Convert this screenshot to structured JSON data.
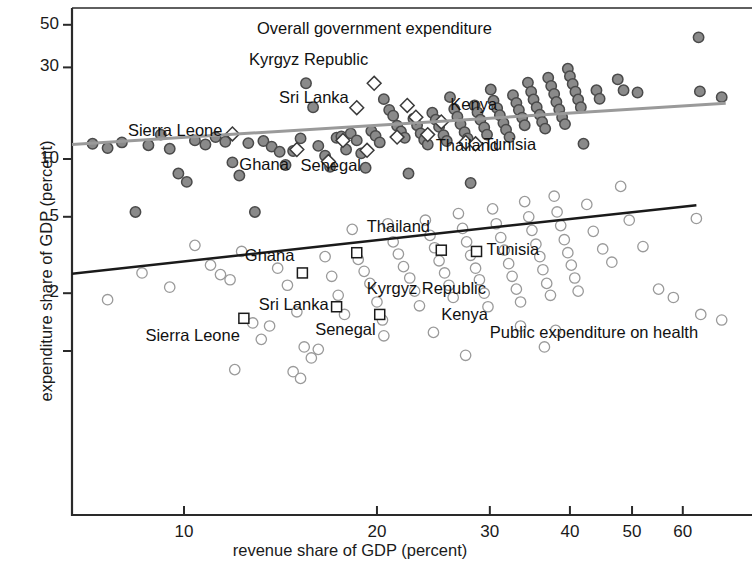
{
  "figure": {
    "axes": {
      "x": {
        "label": "revenue share of GDP (percent)",
        "scale": "log",
        "ticks": [
          10,
          20,
          30,
          40,
          50,
          60
        ],
        "tick_labels": [
          "10",
          "20",
          "30",
          "40",
          "50",
          "60"
        ],
        "range": [
          3.0,
          70.0
        ]
      },
      "y": {
        "label": "expenditure share of GDP (percent)",
        "scale": "log",
        "ticks": [
          50,
          30,
          10,
          5,
          2,
          1
        ],
        "tick_labels": [
          "50",
          "30",
          "10",
          "5",
          "2",
          ""
        ],
        "range": [
          0.55,
          62.0
        ]
      }
    },
    "annotations": {
      "overall_title": "Overall government expenditure",
      "health_title": "Public expenditure on health"
    }
  },
  "chart_data": {
    "type": "scatter",
    "title": "",
    "xlabel": "revenue share of GDP (percent)",
    "ylabel": "expenditure share of GDP (percent)",
    "xscale": "log",
    "yscale": "log",
    "xlim": [
      3.0,
      70.0
    ],
    "ylim": [
      0.55,
      62.0
    ],
    "xticks": [
      10,
      20,
      30,
      40,
      50,
      60
    ],
    "yticks": [
      50,
      30,
      10,
      5,
      2,
      1
    ],
    "grid": false,
    "legend": "none",
    "series": [
      {
        "name": "Overall government expenditure",
        "marker": "circle-filled",
        "color": "#8a8a8a",
        "edge": "#4a4a4a",
        "points": [
          [
            3.3,
            9.2
          ],
          [
            4.0,
            10.3
          ],
          [
            4.5,
            10.5
          ],
          [
            5.1,
            10.8
          ],
          [
            5.6,
            5.5
          ],
          [
            6.4,
            11.6
          ],
          [
            7.2,
            12.0
          ],
          [
            7.6,
            11.4
          ],
          [
            8.0,
            12.2
          ],
          [
            8.4,
            5.3
          ],
          [
            8.8,
            11.8
          ],
          [
            9.2,
            13.4
          ],
          [
            9.5,
            11.3
          ],
          [
            9.8,
            8.4
          ],
          [
            10.1,
            7.6
          ],
          [
            10.4,
            12.5
          ],
          [
            10.8,
            11.9
          ],
          [
            11.2,
            13.0
          ],
          [
            11.6,
            12.3
          ],
          [
            11.9,
            9.6
          ],
          [
            12.2,
            8.2
          ],
          [
            12.6,
            12.1
          ],
          [
            12.9,
            5.3
          ],
          [
            13.3,
            12.4
          ],
          [
            13.7,
            11.6
          ],
          [
            14.1,
            10.9
          ],
          [
            14.4,
            9.3
          ],
          [
            14.8,
            11.0
          ],
          [
            15.2,
            12.8
          ],
          [
            15.5,
            24.8
          ],
          [
            15.9,
            18.6
          ],
          [
            16.2,
            11.7
          ],
          [
            16.6,
            10.4
          ],
          [
            16.9,
            9.1
          ],
          [
            17.3,
            12.9
          ],
          [
            17.6,
            13.1
          ],
          [
            17.9,
            11.2
          ],
          [
            18.2,
            13.6
          ],
          [
            18.6,
            12.5
          ],
          [
            18.9,
            10.7
          ],
          [
            19.2,
            9.0
          ],
          [
            19.6,
            14.0
          ],
          [
            19.9,
            13.2
          ],
          [
            20.2,
            12.2
          ],
          [
            20.5,
            20.5
          ],
          [
            20.9,
            18.0
          ],
          [
            21.2,
            16.8
          ],
          [
            21.5,
            14.9
          ],
          [
            21.8,
            13.9
          ],
          [
            22.1,
            12.9
          ],
          [
            22.4,
            8.4
          ],
          [
            22.8,
            16.2
          ],
          [
            23.1,
            15.0
          ],
          [
            23.4,
            13.6
          ],
          [
            23.7,
            12.6
          ],
          [
            24.0,
            11.9
          ],
          [
            24.4,
            17.4
          ],
          [
            24.7,
            16.0
          ],
          [
            25.0,
            14.7
          ],
          [
            25.4,
            13.3
          ],
          [
            25.7,
            12.4
          ],
          [
            26.0,
            21.0
          ],
          [
            26.4,
            18.2
          ],
          [
            26.7,
            16.6
          ],
          [
            27.0,
            15.2
          ],
          [
            27.4,
            13.8
          ],
          [
            27.7,
            12.8
          ],
          [
            28.0,
            7.5
          ],
          [
            28.4,
            19.0
          ],
          [
            28.7,
            17.5
          ],
          [
            29.0,
            16.0
          ],
          [
            29.4,
            14.6
          ],
          [
            29.7,
            13.4
          ],
          [
            30.1,
            23.0
          ],
          [
            30.4,
            20.1
          ],
          [
            30.8,
            18.4
          ],
          [
            31.1,
            16.9
          ],
          [
            31.5,
            15.4
          ],
          [
            31.8,
            14.2
          ],
          [
            32.2,
            13.0
          ],
          [
            32.6,
            21.5
          ],
          [
            33.0,
            19.6
          ],
          [
            33.3,
            18.0
          ],
          [
            33.7,
            16.4
          ],
          [
            34.0,
            15.0
          ],
          [
            34.4,
            25.0
          ],
          [
            34.8,
            22.4
          ],
          [
            35.1,
            20.4
          ],
          [
            35.5,
            18.6
          ],
          [
            35.9,
            17.0
          ],
          [
            36.2,
            15.6
          ],
          [
            36.6,
            14.4
          ],
          [
            37.0,
            26.5
          ],
          [
            37.4,
            24.0
          ],
          [
            37.8,
            21.8
          ],
          [
            38.1,
            19.8
          ],
          [
            38.5,
            18.1
          ],
          [
            38.9,
            16.5
          ],
          [
            39.3,
            15.2
          ],
          [
            39.7,
            29.5
          ],
          [
            40.0,
            27.0
          ],
          [
            40.4,
            24.6
          ],
          [
            40.8,
            22.4
          ],
          [
            41.2,
            20.4
          ],
          [
            41.6,
            18.6
          ],
          [
            42.0,
            12.0
          ],
          [
            44.0,
            22.8
          ],
          [
            44.5,
            20.6
          ],
          [
            47.5,
            26.0
          ],
          [
            48.5,
            22.8
          ],
          [
            51.0,
            22.2
          ],
          [
            63.5,
            43.0
          ],
          [
            63.8,
            22.5
          ],
          [
            69.0,
            21.0
          ]
        ]
      },
      {
        "name": "Overall government expenditure (highlighted countries)",
        "marker": "diamond",
        "color": "#ffffff",
        "edge": "#3a3a3a",
        "points": [
          [
            11.9,
            13.5
          ],
          [
            15.0,
            11.2
          ],
          [
            16.8,
            9.7
          ],
          [
            17.7,
            12.5
          ],
          [
            18.6,
            18.5
          ],
          [
            19.3,
            11.1
          ],
          [
            19.8,
            24.8
          ],
          [
            21.5,
            13.0
          ],
          [
            22.3,
            19.0
          ],
          [
            23.0,
            16.5
          ],
          [
            24.0,
            13.4
          ],
          [
            25.2,
            15.6
          ],
          [
            27.5,
            12.2
          ],
          [
            28.5,
            12.0
          ]
        ]
      },
      {
        "name": "Public expenditure on health",
        "marker": "circle-open",
        "color": "#ffffff",
        "edge": "#9a9a9a",
        "points": [
          [
            3.4,
            1.72
          ],
          [
            5.0,
            1.55
          ],
          [
            6.2,
            1.3
          ],
          [
            7.6,
            1.85
          ],
          [
            8.6,
            2.55
          ],
          [
            9.5,
            2.15
          ],
          [
            10.4,
            3.55
          ],
          [
            11.0,
            2.8
          ],
          [
            11.4,
            2.5
          ],
          [
            11.8,
            2.35
          ],
          [
            12.3,
            3.3
          ],
          [
            12.8,
            1.4
          ],
          [
            13.2,
            1.15
          ],
          [
            13.6,
            1.35
          ],
          [
            14.0,
            2.7
          ],
          [
            14.5,
            2.2
          ],
          [
            15.0,
            1.6
          ],
          [
            15.4,
            1.05
          ],
          [
            15.8,
            0.92
          ],
          [
            16.2,
            1.02
          ],
          [
            16.6,
            3.1
          ],
          [
            17.0,
            2.45
          ],
          [
            17.4,
            1.95
          ],
          [
            17.8,
            1.55
          ],
          [
            18.3,
            4.3
          ],
          [
            18.7,
            3.0
          ],
          [
            19.1,
            2.6
          ],
          [
            19.5,
            2.25
          ],
          [
            20.0,
            1.8
          ],
          [
            20.4,
            1.45
          ],
          [
            20.8,
            4.6
          ],
          [
            21.2,
            3.7
          ],
          [
            21.6,
            3.2
          ],
          [
            22.0,
            2.75
          ],
          [
            22.5,
            2.4
          ],
          [
            22.9,
            2.05
          ],
          [
            23.3,
            1.72
          ],
          [
            23.8,
            4.8
          ],
          [
            24.2,
            4.0
          ],
          [
            24.6,
            3.45
          ],
          [
            25.0,
            2.95
          ],
          [
            25.5,
            2.55
          ],
          [
            25.9,
            2.2
          ],
          [
            26.3,
            1.9
          ],
          [
            26.8,
            5.2
          ],
          [
            27.2,
            4.35
          ],
          [
            27.6,
            3.7
          ],
          [
            28.0,
            3.15
          ],
          [
            28.5,
            2.7
          ],
          [
            28.9,
            2.35
          ],
          [
            29.4,
            2.0
          ],
          [
            29.8,
            1.7
          ],
          [
            30.3,
            5.5
          ],
          [
            30.7,
            4.6
          ],
          [
            31.2,
            3.9
          ],
          [
            31.6,
            3.35
          ],
          [
            32.1,
            2.85
          ],
          [
            32.5,
            2.45
          ],
          [
            33.0,
            2.1
          ],
          [
            33.5,
            1.8
          ],
          [
            34.0,
            6.0
          ],
          [
            34.5,
            5.0
          ],
          [
            34.9,
            4.25
          ],
          [
            35.4,
            3.6
          ],
          [
            35.9,
            3.1
          ],
          [
            36.3,
            2.65
          ],
          [
            36.8,
            2.25
          ],
          [
            37.3,
            1.95
          ],
          [
            37.8,
            6.4
          ],
          [
            38.2,
            5.3
          ],
          [
            38.7,
            4.5
          ],
          [
            39.2,
            3.8
          ],
          [
            39.7,
            3.25
          ],
          [
            40.2,
            2.8
          ],
          [
            40.7,
            2.4
          ],
          [
            41.2,
            2.05
          ],
          [
            42.5,
            5.8
          ],
          [
            43.5,
            4.2
          ],
          [
            45.0,
            3.4
          ],
          [
            46.5,
            2.9
          ],
          [
            48.0,
            7.2
          ],
          [
            49.5,
            4.8
          ],
          [
            52.0,
            3.5
          ],
          [
            55.0,
            2.1
          ],
          [
            58.0,
            1.9
          ],
          [
            63.0,
            4.9
          ],
          [
            64.0,
            1.55
          ],
          [
            69.0,
            1.45
          ],
          [
            12.0,
            0.8
          ],
          [
            14.8,
            0.78
          ],
          [
            15.2,
            0.72
          ],
          [
            20.5,
            1.2
          ],
          [
            24.5,
            1.25
          ],
          [
            27.5,
            0.95
          ],
          [
            33.5,
            1.35
          ],
          [
            36.5,
            1.05
          ],
          [
            38.0,
            1.28
          ]
        ]
      },
      {
        "name": "Public expenditure on health (highlighted countries)",
        "marker": "square",
        "color": "#ffffff",
        "edge": "#1a1a1a",
        "points": [
          [
            12.4,
            1.48
          ],
          [
            15.3,
            2.55
          ],
          [
            17.3,
            1.7
          ],
          [
            18.6,
            3.25
          ],
          [
            20.2,
            1.55
          ],
          [
            25.2,
            3.35
          ],
          [
            28.6,
            3.3
          ]
        ]
      }
    ],
    "fit_lines": [
      {
        "name": "overall-government-expenditure-fit",
        "color": "#9a9a9a",
        "width": 3,
        "x": [
          3.2,
          70.0
        ],
        "y": [
          10.2,
          19.5
        ]
      },
      {
        "name": "public-expenditure-on-health-fit",
        "color": "#1a1a1a",
        "width": 2.5,
        "x": [
          3.3,
          63.0
        ],
        "y": [
          1.95,
          5.75
        ]
      }
    ],
    "point_labels": [
      {
        "text": "Sierra Leone",
        "series": "overall",
        "x": 11.9,
        "y": 13.5,
        "anchor": "right"
      },
      {
        "text": "Ghana",
        "series": "overall",
        "x": 15.0,
        "y": 11.2,
        "anchor": "left-below"
      },
      {
        "text": "Sri Lanka",
        "series": "overall",
        "x": 18.6,
        "y": 18.5,
        "anchor": "left"
      },
      {
        "text": "Senegal",
        "series": "overall",
        "x": 19.3,
        "y": 11.1,
        "anchor": "below"
      },
      {
        "text": "Kyrgyz Republic",
        "series": "overall",
        "x": 19.8,
        "y": 24.8,
        "anchor": "above"
      },
      {
        "text": "Kenya",
        "series": "overall",
        "x": 25.2,
        "y": 18.5,
        "anchor": "right"
      },
      {
        "text": "Thailand",
        "series": "overall",
        "x": 24.0,
        "y": 13.4,
        "anchor": "right"
      },
      {
        "text": "Tunisia",
        "series": "overall",
        "x": 28.5,
        "y": 12.0,
        "anchor": "right"
      },
      {
        "text": "Sierra Leone",
        "series": "health",
        "x": 12.4,
        "y": 1.48,
        "anchor": "below"
      },
      {
        "text": "Sri Lanka",
        "series": "health",
        "x": 17.3,
        "y": 1.7,
        "anchor": "left"
      },
      {
        "text": "Ghana",
        "series": "health",
        "x": 15.3,
        "y": 2.55,
        "anchor": "above"
      },
      {
        "text": "Senegal",
        "series": "health",
        "x": 20.2,
        "y": 1.55,
        "anchor": "left"
      },
      {
        "text": "Kenya",
        "series": "health",
        "x": 24.3,
        "y": 1.52,
        "anchor": "right"
      },
      {
        "text": "Kyrgyz Republic",
        "series": "health",
        "x": 18.6,
        "y": 2.4,
        "anchor": "right"
      },
      {
        "text": "Thailand",
        "series": "health",
        "x": 18.6,
        "y": 3.85,
        "anchor": "right"
      },
      {
        "text": "Tunisia",
        "series": "health",
        "x": 28.6,
        "y": 3.3,
        "anchor": "right"
      }
    ],
    "group_titles": [
      {
        "text": "Overall government expenditure",
        "x": 13.0,
        "y": 47.0
      },
      {
        "text": "Public expenditure on health",
        "x": 30.0,
        "y": 1.22
      }
    ]
  }
}
